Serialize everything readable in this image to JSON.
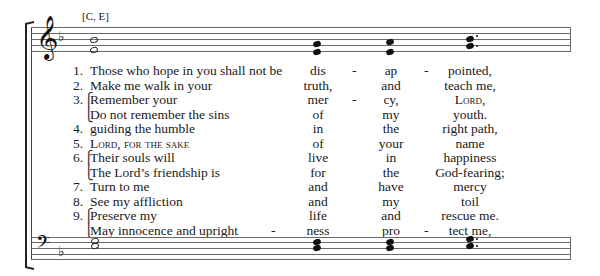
{
  "chord_label": "[C, E]",
  "treble_staff": {
    "clef": "treble-clef",
    "key_signature": "one flat (F major / D minor)",
    "chords": [
      {
        "position": 1,
        "notes": [
          "E5",
          "C5"
        ],
        "type": "whole-notes (hollow)"
      },
      {
        "position": 2,
        "notes": [
          "D5",
          "B4"
        ],
        "type": "filled"
      },
      {
        "position": 3,
        "notes": [
          "E5",
          "B4"
        ],
        "type": "filled"
      },
      {
        "position": 4,
        "notes": [
          "F5",
          "D5"
        ],
        "type": "filled, dotted"
      }
    ]
  },
  "bass_staff": {
    "clef": "bass-clef",
    "key_signature": "one flat",
    "chords": [
      {
        "position": 1,
        "notes": [
          "C4",
          "A3"
        ],
        "type": "whole-notes (hollow)"
      },
      {
        "position": 2,
        "notes": [
          "A3",
          "F3"
        ],
        "type": "filled"
      },
      {
        "position": 3,
        "notes": [
          "A3",
          "F3"
        ],
        "type": "filled"
      },
      {
        "position": 4,
        "notes": [
          "C4",
          "A3"
        ],
        "type": "filled, dotted"
      }
    ]
  },
  "verses": [
    {
      "num": "1.",
      "brace": "",
      "text": "Those who hope in you shall not be",
      "pre": "",
      "c1": "dis",
      "d1": "-",
      "c2": "ap",
      "d2": "-",
      "c3": "pointed,"
    },
    {
      "num": "2.",
      "brace": "",
      "text": "Make me walk in your",
      "pre": "",
      "c1": "truth,",
      "d1": "",
      "c2": "and",
      "d2": "",
      "c3": "teach me,"
    },
    {
      "num": "3.",
      "brace": "⎧",
      "text": "Remember your",
      "pre": "",
      "c1": "mer",
      "d1": "-",
      "c2": "cy,",
      "d2": "",
      "c3": "Lord,"
    },
    {
      "num": "",
      "brace": "⎩",
      "text": "Do not remember the sins",
      "pre": "",
      "c1": "of",
      "d1": "",
      "c2": "my",
      "d2": "",
      "c3": "youth."
    },
    {
      "num": "4.",
      "brace": "",
      "text": "guiding the humble",
      "pre": "",
      "c1": "in",
      "d1": "",
      "c2": "the",
      "d2": "",
      "c3": "right path,"
    },
    {
      "num": "5.",
      "brace": "",
      "text": "Lord, for the sake",
      "pre": "",
      "c1": "of",
      "d1": "",
      "c2": "your",
      "d2": "",
      "c3": "name"
    },
    {
      "num": "6.",
      "brace": "⎧",
      "text": "Their souls will",
      "pre": "",
      "c1": "live",
      "d1": "",
      "c2": "in",
      "d2": "",
      "c3": "happiness"
    },
    {
      "num": "",
      "brace": "⎩",
      "text": "The Lord’s friendship is",
      "pre": "",
      "c1": "for",
      "d1": "",
      "c2": "the",
      "d2": "",
      "c3": "God-fearing;"
    },
    {
      "num": "7.",
      "brace": "",
      "text": "Turn to me",
      "pre": "",
      "c1": "and",
      "d1": "",
      "c2": "have",
      "d2": "",
      "c3": "mercy"
    },
    {
      "num": "8.",
      "brace": "",
      "text": "See my affliction",
      "pre": "",
      "c1": "and",
      "d1": "",
      "c2": "my",
      "d2": "",
      "c3": "toil"
    },
    {
      "num": "9.",
      "brace": "⎧",
      "text": "Preserve my",
      "pre": "",
      "c1": "life",
      "d1": "",
      "c2": "and",
      "d2": "",
      "c3": "rescue me."
    },
    {
      "num": "",
      "brace": "⎩",
      "text": "May innocence and upright",
      "pre": "-",
      "c1": "ness",
      "d1": "",
      "c2": "pro",
      "d2": "-",
      "c3": "tect me,"
    }
  ]
}
